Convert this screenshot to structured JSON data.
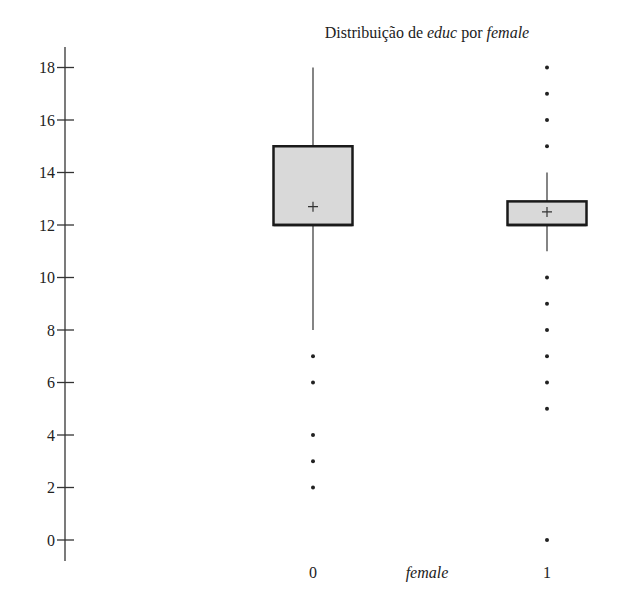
{
  "chart_data": {
    "type": "boxplot",
    "title": "Distribuição de educ por female",
    "title_parts": [
      {
        "text": "Distribuição de ",
        "italic": false
      },
      {
        "text": "educ",
        "italic": true
      },
      {
        "text": " por ",
        "italic": false
      },
      {
        "text": "female",
        "italic": true
      }
    ],
    "xlabel": "female",
    "ylabel": "",
    "categories": [
      "0",
      "1"
    ],
    "y_ticks": [
      0,
      2,
      4,
      6,
      8,
      10,
      12,
      14,
      16,
      18
    ],
    "ylim": [
      0,
      18
    ],
    "grid": false,
    "legend": null,
    "series": [
      {
        "name": "0",
        "q1": 12,
        "median": 12,
        "q3": 15,
        "mean": 12.7,
        "whisker_low": 8,
        "whisker_high": 18,
        "outliers": [
          7,
          6,
          4,
          3,
          2
        ]
      },
      {
        "name": "1",
        "q1": 12,
        "median": 12,
        "q3": 12.9,
        "mean": 12.5,
        "whisker_low": 11,
        "whisker_high": 14,
        "outliers": [
          18,
          17,
          16,
          15,
          10,
          9,
          8,
          7,
          6,
          5,
          0
        ]
      }
    ],
    "colors": {
      "box_fill": "#d9d9d9",
      "box_stroke": "#1a1a1a",
      "line": "#333333"
    }
  }
}
